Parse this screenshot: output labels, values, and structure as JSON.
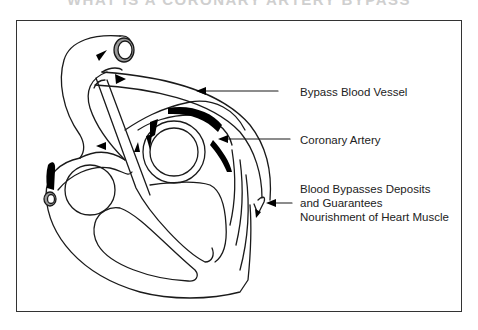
{
  "title": "WHAT IS A CORONARY ARTERY BYPASS",
  "labels": {
    "bypass_vessel": "Bypass Blood Vessel",
    "coronary_artery": "Coronary Artery",
    "bypass_note_line1": "Blood Bypasses Deposits",
    "bypass_note_line2": "and Guarantees",
    "bypass_note_line3": "Nourishment of Heart Muscle"
  },
  "colors": {
    "line": "#1a1a1a",
    "deposit": "#000000",
    "vessel_ring": "#9a9a9a",
    "title": "#cfcfcf"
  },
  "icons": [
    "arrow-icon",
    "heart-diagram",
    "plaque-deposit",
    "aorta-opening"
  ]
}
